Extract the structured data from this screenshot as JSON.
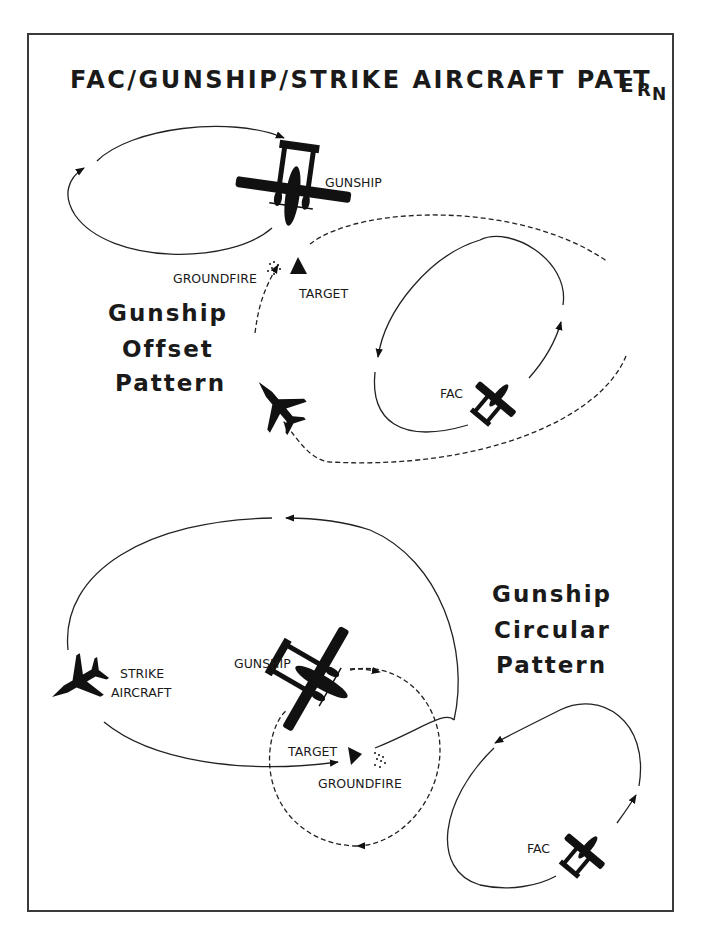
{
  "title": {
    "part1": "FAC/GUNSHIP/STRIKE AIRCRAFT PATT",
    "part2": "E",
    "part3": "R",
    "part4": "N",
    "full": "FAC/GUNSHIP/STRIKE AIRCRAFT PATTERN"
  },
  "offset_pattern": {
    "heading": [
      "Gunship",
      "Offset",
      "Pattern"
    ],
    "labels": {
      "gunship": "GUNSHIP",
      "groundfire": "GROUNDFIRE",
      "target": "TARGET",
      "fac": "FAC"
    }
  },
  "circular_pattern": {
    "heading": [
      "Gunship",
      "Circular",
      "Pattern"
    ],
    "labels": {
      "strike_line1": "STRIKE",
      "strike_line2": "AIRCRAFT",
      "gunship": "GUNSHIP",
      "target": "TARGET",
      "groundfire": "GROUNDFIRE",
      "fac": "FAC"
    }
  },
  "icons": [
    "gunship-aircraft-icon",
    "fac-aircraft-icon",
    "strike-jet-icon",
    "target-triangle-icon",
    "groundfire-dots-icon"
  ],
  "colors": {
    "ink": "#111111",
    "frame": "#3a3a3a",
    "background": "#ffffff"
  }
}
